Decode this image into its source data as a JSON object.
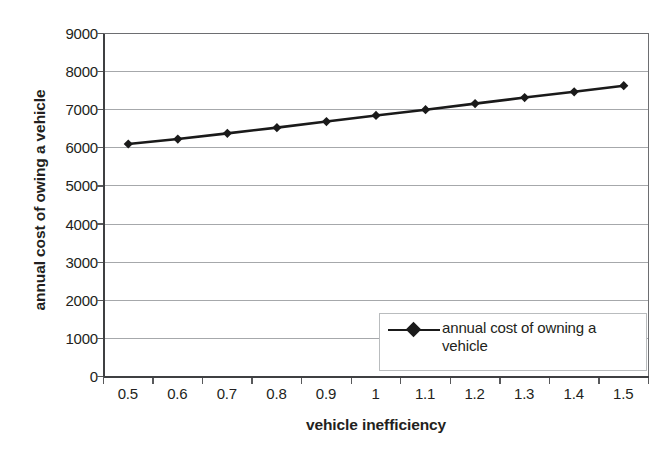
{
  "chart_data": {
    "type": "line",
    "title": "",
    "xlabel": "vehicle inefficiency",
    "ylabel": "annual cost of owing a vehicle",
    "categories": [
      "0.5",
      "0.6",
      "0.7",
      "0.8",
      "0.9",
      "1",
      "1.1",
      "1.2",
      "1.3",
      "1.4",
      "1.5"
    ],
    "x": [
      0.5,
      0.6,
      0.7,
      0.8,
      0.9,
      1.0,
      1.1,
      1.2,
      1.3,
      1.4,
      1.5
    ],
    "series": [
      {
        "name": "annual cost of owning a vehicle",
        "values": [
          6100,
          6230,
          6380,
          6530,
          6690,
          6850,
          7000,
          7160,
          7320,
          7470,
          7630
        ],
        "marker": "diamond",
        "color": "#1a1a1a"
      }
    ],
    "ylim": [
      0,
      9000
    ],
    "yticks": [
      0,
      1000,
      2000,
      3000,
      4000,
      5000,
      6000,
      7000,
      8000,
      9000
    ],
    "ytick_labels": [
      "0",
      "1000",
      "2000",
      "3000",
      "4000",
      "5000",
      "6000",
      "7000",
      "8000",
      "9000"
    ],
    "grid": "horizontal",
    "legend_position": "inside-lower-right",
    "legend_entries": [
      "annual cost of owning a vehicle"
    ],
    "plot_background": "#ffffff",
    "gridline_color": "#a6a8ab",
    "axis_color": "#58595b"
  },
  "axes": {
    "y_title": "annual cost of owing a vehicle",
    "x_title": "vehicle inefficiency"
  },
  "legend": {
    "label": "annual cost of owning a vehicle"
  }
}
